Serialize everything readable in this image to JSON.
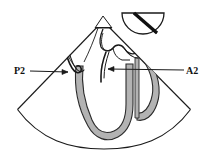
{
  "figure": {
    "background_color": "#ffffff",
    "stroke_color": "#1a1a1a",
    "tissue_fill": "#b3b3b3",
    "tissue_stroke": "#2b2b2b",
    "sector": {
      "name": "ultrasound-sector-fan",
      "apex_x": 103,
      "apex_y": 20,
      "left_edge_end_x": 17,
      "left_edge_end_y": 110,
      "right_edge_end_x": 191,
      "right_edge_end_y": 110,
      "arc_depth_y": 147
    },
    "probe_icon": {
      "name": "transducer-orientation-icon",
      "shape": "semicircle",
      "center_x": 143,
      "center_y": 13,
      "radius": 21,
      "marker_angle_deg": 55,
      "marker_color": "#111111"
    },
    "apex_marker": {
      "name": "sector-apex-triangle",
      "x": 103,
      "y": 20,
      "half_width": 8,
      "height": 9
    }
  },
  "annotations": [
    {
      "id": "p2",
      "label": "P2",
      "label_x": 14,
      "label_y": 74,
      "leader_from_x": 30,
      "leader_from_y": 71,
      "leader_to_x": 68,
      "leader_to_y": 72,
      "arrowhead": "right",
      "description": "Posterior mitral leaflet middle scallop"
    },
    {
      "id": "a2",
      "label": "A2",
      "label_x": 186,
      "label_y": 74,
      "leader_from_x": 184,
      "leader_from_y": 70,
      "leader_to_x": 108,
      "leader_to_y": 69,
      "arrowhead": "left",
      "description": "Anterior mitral leaflet middle scallop"
    }
  ],
  "structures": [
    {
      "name": "left-ventricle-wall-u-shape",
      "fill": "#b3b3b3"
    },
    {
      "name": "right-ventricular-loop",
      "fill": "#b3b3b3"
    },
    {
      "name": "posterior-leaflet-outline",
      "fill": "none"
    },
    {
      "name": "anterior-leaflet-outline",
      "fill": "none"
    },
    {
      "name": "atrial-septum-outline",
      "fill": "none"
    }
  ]
}
